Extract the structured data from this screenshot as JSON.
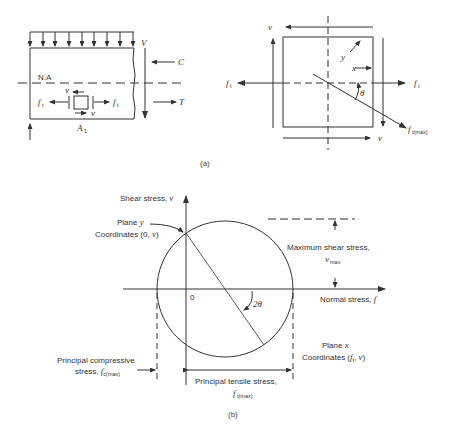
{
  "figure": {
    "caption_a": "(a)",
    "caption_b": "(b)",
    "colors": {
      "stroke": "#333333",
      "background": "#ffffff"
    }
  },
  "beam": {
    "shear_label": "V",
    "compression_label": "C",
    "tension_label": "T",
    "neutral_axis_label": "N.A",
    "tensile_label_left": "f",
    "tensile_label_right": "f",
    "tensile_sub": "t",
    "shear_top": "v",
    "shear_bottom": "v",
    "area_label": "A",
    "area_sub": "1"
  },
  "element": {
    "shear_top": "v",
    "shear_bottom": "v",
    "plane_y_label": "y",
    "plane_x_label": "x",
    "angle_label": "θ",
    "tensile_left": "f",
    "tensile_right": "f",
    "tensile_sub": "t",
    "principal_label": "f",
    "principal_sub": "t(max)"
  },
  "mohr": {
    "y_axis_label": "Shear stress, ",
    "y_axis_var": "v",
    "x_axis_label": "Normal stress, ",
    "x_axis_var": "f",
    "origin_label": "0",
    "plane_y": "Plane ",
    "plane_y_var": "y",
    "coords_y": "Coordinates (0, ",
    "coords_y_var": "v",
    "coords_y_end": ")",
    "angle_label": "2θ",
    "max_shear_line1": "Maximum shear stress,",
    "max_shear_var": "v",
    "max_shear_sub": "max",
    "plane_x": "Plane ",
    "plane_x_var": "x",
    "coords_x": "Coordinates (",
    "coords_x_var": "f",
    "coords_x_sub": "t",
    "coords_x_mid": ", ",
    "coords_x_var2": "v",
    "coords_x_end": ")",
    "compressive_line1": "Principal compressive",
    "compressive_line2": "stress, ",
    "compressive_var": "f",
    "compressive_sub": "c(max)",
    "tensile_line1": "Principal tensile stress,",
    "tensile_var": "f",
    "tensile_sub": "t(max)"
  }
}
